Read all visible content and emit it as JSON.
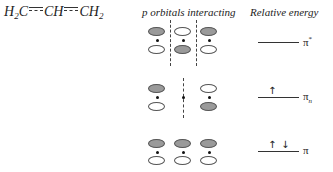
{
  "molecule": {
    "formula_parts": [
      "H",
      "2",
      "C",
      "CH",
      "CH",
      "2"
    ],
    "description": "H2C=CH=CH2 (allyl, delocalized bonds)"
  },
  "headers": {
    "orbitals": "p orbitals interacting",
    "energy": "Relative energy"
  },
  "levels": [
    {
      "name": "pi-star",
      "label": "π",
      "label_sup": "*",
      "label_sub": "",
      "electrons": [],
      "orbitals": [
        {
          "top": "gray",
          "bottom": "white"
        },
        {
          "top": "white",
          "bottom": "gray"
        },
        {
          "top": "gray",
          "bottom": "white"
        }
      ],
      "nodes": 2
    },
    {
      "name": "pi-n",
      "label": "π",
      "label_sup": "",
      "label_sub": "n",
      "electrons": [
        "↑"
      ],
      "orbitals": [
        {
          "top": "gray",
          "bottom": "white"
        },
        null,
        {
          "top": "white",
          "bottom": "gray"
        }
      ],
      "nodes": 1
    },
    {
      "name": "pi",
      "label": "π",
      "label_sup": "",
      "label_sub": "",
      "electrons": [
        "↑",
        "↓"
      ],
      "orbitals": [
        {
          "top": "gray",
          "bottom": "white"
        },
        {
          "top": "gray",
          "bottom": "white"
        },
        {
          "top": "gray",
          "bottom": "white"
        }
      ],
      "nodes": 0
    }
  ],
  "colors": {
    "lobe_shaded": "#9a9a9a",
    "lobe_unshaded": "#ffffff",
    "line": "#333333"
  }
}
